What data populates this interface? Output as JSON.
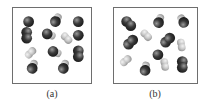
{
  "figure": {
    "panels": [
      {
        "id": "a",
        "label": "(a)",
        "molecules": [
          {
            "kind": "dark-single"
          },
          {
            "kind": "dark-with-light"
          },
          {
            "kind": "dark-single"
          },
          {
            "kind": "dark-pair"
          },
          {
            "kind": "dark-with-light"
          },
          {
            "kind": "light-pair"
          },
          {
            "kind": "dark-single"
          },
          {
            "kind": "dark-with-light"
          },
          {
            "kind": "light-pair"
          },
          {
            "kind": "dark-pair"
          },
          {
            "kind": "dark-with-light"
          },
          {
            "kind": "dark-with-light"
          }
        ]
      },
      {
        "id": "b",
        "label": "(b)",
        "molecules": [
          {
            "kind": "dark-pair"
          },
          {
            "kind": "dark-with-light"
          },
          {
            "kind": "dark-with-light"
          },
          {
            "kind": "light-pair"
          },
          {
            "kind": "dark-pair"
          },
          {
            "kind": "dark-pair"
          },
          {
            "kind": "light-pair"
          },
          {
            "kind": "dark-single"
          },
          {
            "kind": "light-pair"
          },
          {
            "kind": "light-pair"
          },
          {
            "kind": "dark-with-light"
          },
          {
            "kind": "dark-pair"
          }
        ]
      }
    ],
    "colors": {
      "dark_atom": "#3a3a3a",
      "light_atom": "#c8c8c8",
      "border": "#6e6e6e"
    }
  }
}
